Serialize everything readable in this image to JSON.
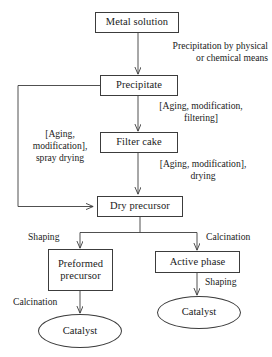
{
  "diagram": {
    "line_color": "#3c3c3c",
    "text_color": "#1a1a1a",
    "background": "#ffffff",
    "nodes": [
      {
        "id": "metal_solution",
        "label": "Metal solution",
        "shape": "rectangle"
      },
      {
        "id": "precipitate",
        "label": "Precipitate",
        "shape": "rectangle"
      },
      {
        "id": "filter_cake",
        "label": "Filter cake",
        "shape": "rectangle"
      },
      {
        "id": "dry_precursor",
        "label": "Dry precursor",
        "shape": "rectangle"
      },
      {
        "id": "preformed_precursor",
        "label": "Preformed\nprecursor",
        "shape": "rectangle"
      },
      {
        "id": "active_phase",
        "label": "Active phase",
        "shape": "rectangle"
      },
      {
        "id": "catalyst_left",
        "label": "Catalyst",
        "shape": "ellipse"
      },
      {
        "id": "catalyst_right",
        "label": "Catalyst",
        "shape": "ellipse"
      }
    ],
    "edge_labels": [
      {
        "id": "precipitation",
        "text": "Precipitation by physical\nor chemical means"
      },
      {
        "id": "aging_filtering",
        "text": "[Aging, modification,\nfiltering]"
      },
      {
        "id": "aging_drying",
        "text": "[Aging, modification],\ndrying"
      },
      {
        "id": "aging_spray_drying",
        "text": "[Aging,\nmodification],\nspray drying"
      },
      {
        "id": "shaping_left",
        "text": "Shaping"
      },
      {
        "id": "calcination_right",
        "text": "Calcination"
      },
      {
        "id": "calcination_left",
        "text": "Calcination"
      },
      {
        "id": "shaping_right",
        "text": "Shaping"
      }
    ]
  }
}
